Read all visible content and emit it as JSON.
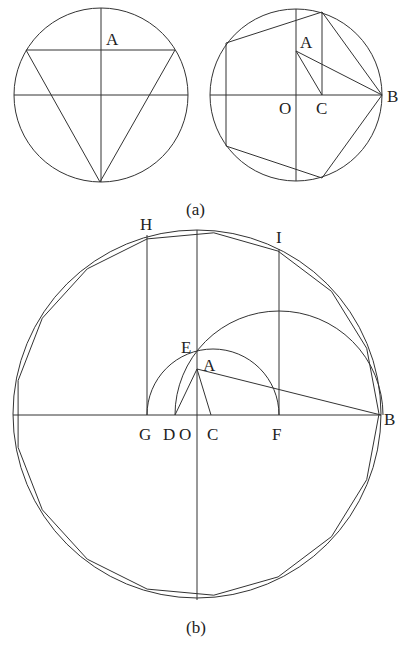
{
  "figures": {
    "a_left": {
      "caption": "",
      "circle": {
        "cx": 101,
        "cy": 95,
        "r": 87
      },
      "lines": [
        [
          101,
          8,
          101,
          182
        ],
        [
          14,
          95,
          188,
          95
        ],
        [
          26,
          50,
          175,
          50
        ],
        [
          26,
          50,
          100,
          182
        ],
        [
          175,
          50,
          100,
          182
        ]
      ],
      "labels": [
        {
          "text": "A",
          "x": 106,
          "y": 45
        }
      ]
    },
    "a_right": {
      "circle": {
        "cx": 296,
        "cy": 95,
        "r": 86
      },
      "lines": [
        [
          296,
          9,
          296,
          181
        ],
        [
          210,
          95,
          382,
          95
        ],
        [
          322,
          95,
          322,
          12
        ],
        [
          296,
          51,
          322,
          95
        ],
        [
          296,
          51,
          382,
          95
        ]
      ],
      "polygon": [
        [
          382,
          95
        ],
        [
          322,
          12
        ],
        [
          226,
          43
        ],
        [
          226,
          146
        ],
        [
          322,
          178
        ]
      ],
      "labels": [
        {
          "text": "A",
          "x": 300,
          "y": 48
        },
        {
          "text": "O",
          "x": 279,
          "y": 114
        },
        {
          "text": "C",
          "x": 316,
          "y": 114
        },
        {
          "text": "B",
          "x": 387,
          "y": 102
        }
      ]
    },
    "caption_a": {
      "text": "(a)",
      "x": 186,
      "y": 215
    },
    "b": {
      "circle": {
        "cx": 197,
        "cy": 414,
        "r": 184
      },
      "polygon_sides": 17,
      "polygon_start_angle_deg": 0,
      "lines": [
        [
          197,
          230,
          197,
          600
        ],
        [
          13,
          415,
          381,
          415
        ],
        [
          147,
          415,
          147,
          235
        ],
        [
          279,
          415,
          279,
          249
        ],
        [
          197,
          369,
          381,
          415
        ],
        [
          197,
          369,
          175,
          415
        ],
        [
          197,
          369,
          211,
          415
        ]
      ],
      "arcs": [
        {
          "d": "M147,415 A66,66 0 0 1 279,415"
        },
        {
          "d": "M175,415 A104,104 0 0 1 383,415"
        }
      ],
      "labels": [
        {
          "text": "H",
          "x": 140,
          "y": 230
        },
        {
          "text": "I",
          "x": 276,
          "y": 243
        },
        {
          "text": "E",
          "x": 181,
          "y": 353
        },
        {
          "text": "A",
          "x": 203,
          "y": 371
        },
        {
          "text": "G",
          "x": 139,
          "y": 440
        },
        {
          "text": "D",
          "x": 163,
          "y": 440
        },
        {
          "text": "O",
          "x": 179,
          "y": 440
        },
        {
          "text": "C",
          "x": 207,
          "y": 440
        },
        {
          "text": "F",
          "x": 272,
          "y": 440
        },
        {
          "text": "B",
          "x": 384,
          "y": 425
        }
      ]
    },
    "caption_b": {
      "text": "(b)",
      "x": 186,
      "y": 633
    }
  }
}
